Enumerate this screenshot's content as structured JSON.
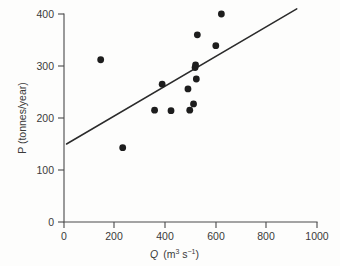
{
  "chart_data": {
    "type": "scatter",
    "title": "",
    "subtitle": "",
    "xlabel": "Q (m^3 s^-1)",
    "xlabel_parts": {
      "symbol": "Q",
      "unit_open": "(m",
      "unit_sup1": "3",
      "unit_mid": " s",
      "unit_sup2": "−1",
      "unit_close": ")"
    },
    "ylabel": "P (tonnes/year)",
    "xlim": [
      0,
      1000
    ],
    "ylim": [
      0,
      400
    ],
    "xticks": [
      0,
      200,
      400,
      600,
      800,
      1000
    ],
    "yticks": [
      0,
      100,
      200,
      300,
      400
    ],
    "xtick_labels": [
      "0",
      "200",
      "400",
      "600",
      "800",
      "1000"
    ],
    "ytick_labels": [
      "0",
      "100",
      "200",
      "300",
      "400"
    ],
    "grid": false,
    "legend": false,
    "legend_position": "none",
    "spines": [
      "left",
      "bottom"
    ],
    "tick_direction": "out",
    "marker": "filled-circle",
    "marker_color": "#1d1d1d",
    "marker_size_px": 3.4,
    "points": [
      {
        "x": 145,
        "y": 312
      },
      {
        "x": 232,
        "y": 143
      },
      {
        "x": 358,
        "y": 215
      },
      {
        "x": 388,
        "y": 265
      },
      {
        "x": 423,
        "y": 214
      },
      {
        "x": 490,
        "y": 256
      },
      {
        "x": 497,
        "y": 215
      },
      {
        "x": 512,
        "y": 227
      },
      {
        "x": 518,
        "y": 297
      },
      {
        "x": 520,
        "y": 302
      },
      {
        "x": 523,
        "y": 275
      },
      {
        "x": 527,
        "y": 360
      },
      {
        "x": 600,
        "y": 339
      },
      {
        "x": 622,
        "y": 400
      }
    ],
    "trendline": {
      "type": "linear-fit",
      "color": "#2b2b2b",
      "x_start": 10,
      "y_start": 150,
      "x_end": 920,
      "y_end": 410,
      "slope": 0.2857,
      "intercept": 147.1
    }
  },
  "figure": {
    "background_color": "#fdfdfc",
    "ink_color": "#3a3a3a"
  }
}
